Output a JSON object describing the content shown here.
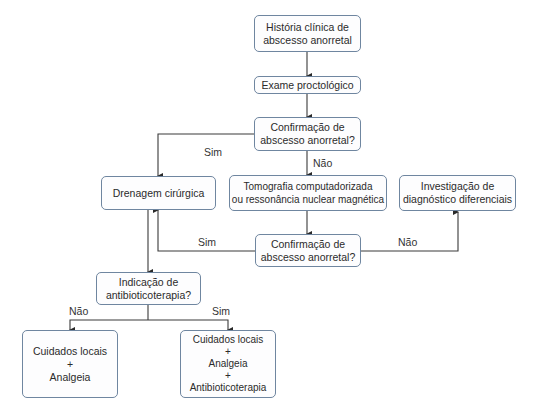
{
  "nodes": {
    "historia": "História clínica de\nabscesso anorretal",
    "exame": "Exame proctológico",
    "confirmacao1": "Confirmação de\nabscesso anorretal?",
    "drenagem": "Drenagem cirúrgica",
    "tomografia": "Tomografia computadorizada\nou ressonância nuclear magnética",
    "investigacao": "Investigação de\ndiagnóstico diferenciais",
    "confirmacao2": "Confirmação de\nabscesso anorretal?",
    "indicacao": "Indicação de\nantibioticoterapia?",
    "cuidados_nao": "Cuidados locais\n+\nAnalgeia",
    "cuidados_sim": "Cuidados locais\n+\nAnalgeia\n+\nAntibioticoterapia"
  },
  "edge_labels": {
    "conf1_sim": "Sim",
    "conf1_nao": "Não",
    "conf2_sim": "Sim",
    "conf2_nao": "Não",
    "ind_nao": "Não",
    "ind_sim": "Sim"
  },
  "colors": {
    "box_border": "#6f86a0",
    "line": "#3a3a3a"
  }
}
